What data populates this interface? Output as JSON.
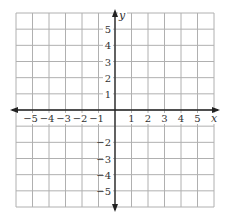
{
  "chart_data": {
    "type": "scatter",
    "title": "",
    "xlabel": "x",
    "ylabel": "y",
    "xlim": [
      -6,
      6
    ],
    "ylim": [
      -6,
      6
    ],
    "grid": true,
    "x_ticks": [
      -5,
      -4,
      -3,
      -2,
      -1,
      1,
      2,
      3,
      4,
      5
    ],
    "y_ticks": [
      5,
      4,
      3,
      2,
      1,
      -2,
      -3,
      -4,
      -5
    ],
    "x_tick_labels": [
      "−5",
      "−4",
      "−3",
      "−2",
      "−1",
      "1",
      "2",
      "3",
      "4",
      "5"
    ],
    "y_tick_labels": [
      "5",
      "4",
      "3",
      "2",
      "1",
      "−2",
      "−3",
      "−4",
      "−5"
    ],
    "points": []
  },
  "colors": {
    "grid": "#b0b0b0",
    "axis": "#222222",
    "text": "#333333"
  }
}
